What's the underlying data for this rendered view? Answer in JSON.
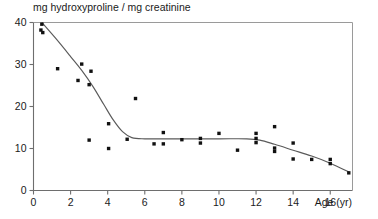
{
  "chart_data": {
    "type": "scatter",
    "title": "mg hydroxyproline / mg creatinine",
    "xlabel": "Age (yr)",
    "ylabel": "",
    "xlim": [
      0,
      17.2
    ],
    "ylim": [
      0,
      40
    ],
    "grid": false,
    "legend": null,
    "x_ticks": [
      0,
      2,
      4,
      6,
      8,
      10,
      12,
      14,
      16
    ],
    "x_tick_labels": [
      "0",
      "2",
      "4",
      "6",
      "8",
      "10",
      "12",
      "14",
      "16"
    ],
    "y_ticks": [
      0,
      10,
      20,
      30,
      40
    ],
    "y_tick_labels": [
      "0",
      "10",
      "20",
      "30",
      "40"
    ],
    "marker": "square",
    "marker_color": "#111111",
    "points": [
      {
        "x": 0.45,
        "y": 39.6
      },
      {
        "x": 0.4,
        "y": 38.2
      },
      {
        "x": 0.5,
        "y": 37.6
      },
      {
        "x": 1.3,
        "y": 29.0
      },
      {
        "x": 2.6,
        "y": 30.1
      },
      {
        "x": 2.4,
        "y": 26.2
      },
      {
        "x": 3.1,
        "y": 28.4
      },
      {
        "x": 3.0,
        "y": 25.2
      },
      {
        "x": 5.5,
        "y": 21.9
      },
      {
        "x": 4.05,
        "y": 15.9
      },
      {
        "x": 3.0,
        "y": 12.0
      },
      {
        "x": 4.05,
        "y": 10.0
      },
      {
        "x": 5.05,
        "y": 12.2
      },
      {
        "x": 6.5,
        "y": 11.1
      },
      {
        "x": 7.0,
        "y": 11.1
      },
      {
        "x": 7.0,
        "y": 13.8
      },
      {
        "x": 8.0,
        "y": 12.1
      },
      {
        "x": 9.0,
        "y": 12.4
      },
      {
        "x": 9.0,
        "y": 11.3
      },
      {
        "x": 10.0,
        "y": 13.6
      },
      {
        "x": 11.0,
        "y": 9.6
      },
      {
        "x": 12.0,
        "y": 13.6
      },
      {
        "x": 12.0,
        "y": 12.4
      },
      {
        "x": 12.0,
        "y": 11.4
      },
      {
        "x": 13.0,
        "y": 15.2
      },
      {
        "x": 13.0,
        "y": 10.1
      },
      {
        "x": 13.0,
        "y": 9.3
      },
      {
        "x": 14.0,
        "y": 11.3
      },
      {
        "x": 14.0,
        "y": 7.5
      },
      {
        "x": 15.0,
        "y": 7.4
      },
      {
        "x": 16.0,
        "y": 7.4
      },
      {
        "x": 16.0,
        "y": 6.4
      },
      {
        "x": 17.0,
        "y": 4.2
      }
    ],
    "fit_line": {
      "name": "smoothed trend",
      "color": "#5a5a5a",
      "points": [
        {
          "x": 0.45,
          "y": 40.0
        },
        {
          "x": 1.2,
          "y": 36.2
        },
        {
          "x": 2.0,
          "y": 31.9
        },
        {
          "x": 2.6,
          "y": 28.6
        },
        {
          "x": 3.2,
          "y": 24.8
        },
        {
          "x": 3.8,
          "y": 20.4
        },
        {
          "x": 4.3,
          "y": 16.8
        },
        {
          "x": 4.8,
          "y": 14.0
        },
        {
          "x": 5.3,
          "y": 12.6
        },
        {
          "x": 6.0,
          "y": 12.3
        },
        {
          "x": 8.0,
          "y": 12.3
        },
        {
          "x": 10.0,
          "y": 12.3
        },
        {
          "x": 11.5,
          "y": 12.3
        },
        {
          "x": 12.2,
          "y": 12.0
        },
        {
          "x": 13.0,
          "y": 11.0
        },
        {
          "x": 14.0,
          "y": 9.6
        },
        {
          "x": 15.0,
          "y": 8.2
        },
        {
          "x": 16.0,
          "y": 6.5
        },
        {
          "x": 17.0,
          "y": 4.4
        }
      ]
    }
  }
}
